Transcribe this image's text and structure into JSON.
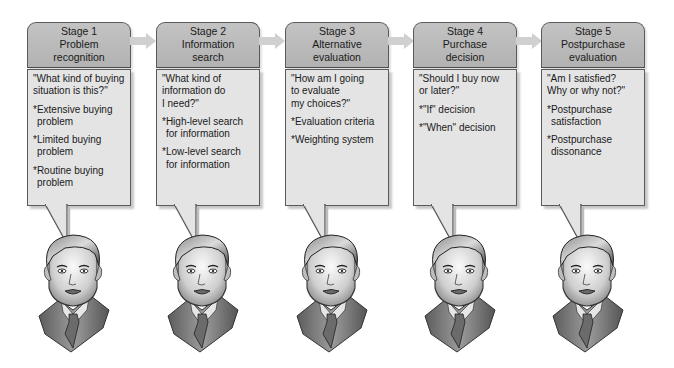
{
  "diagram": {
    "type": "consumer-purchase-decision-process",
    "stages": [
      {
        "number_label": "Stage 1",
        "title_lines": [
          "Problem",
          "recognition"
        ],
        "question": "\"What kind of buying\nsituation is this?\"",
        "bullets": [
          "*Extensive buying\nproblem",
          "*Limited buying\nproblem",
          "*Routine buying\nproblem"
        ]
      },
      {
        "number_label": "Stage 2",
        "title_lines": [
          "Information",
          "search"
        ],
        "question": "\"What kind of\ninformation do\nI need?\"",
        "bullets": [
          "*High-level search\nfor information",
          "*Low-level search\nfor information"
        ]
      },
      {
        "number_label": "Stage 3",
        "title_lines": [
          "Alternative",
          "evaluation"
        ],
        "question": "\"How am I going\nto evaluate\nmy choices?\"",
        "bullets": [
          "*Evaluation criteria",
          "*Weighting system"
        ]
      },
      {
        "number_label": "Stage 4",
        "title_lines": [
          "Purchase",
          "decision"
        ],
        "question": "\"Should I buy now\nor later?\"",
        "bullets": [
          "*\"If\" decision",
          "*\"When\" decision"
        ]
      },
      {
        "number_label": "Stage 5",
        "title_lines": [
          "Postpurchase",
          "evaluation"
        ],
        "question": "\"Am I satisfied?\nWhy or why not?\"",
        "bullets": [
          "*Postpurchase\nsatisfaction",
          "*Postpurchase\ndissonance"
        ]
      }
    ],
    "icons": {
      "connector": "right-arrow-icon",
      "figure": "thinking-man-face-icon"
    },
    "colors": {
      "header_fill": "#b8b8b8",
      "body_fill": "#e4e4e4",
      "border": "#5a5a5a",
      "arrow": "#cfcfcf"
    }
  }
}
